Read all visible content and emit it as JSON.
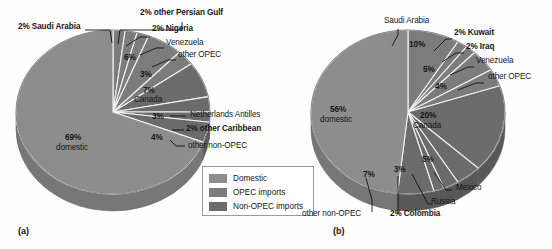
{
  "figure": {
    "background": "#fefefe",
    "colors": {
      "domestic": "#8d8d8d",
      "opec": "#7c7c7c",
      "non_opec": "#6b6b6b",
      "domestic_side": "#777777",
      "opec_side": "#666666",
      "non_opec_side": "#585858",
      "separator": "#f2f2f2",
      "outline": "#5a5a5a",
      "text": "#161616",
      "legend_border": "#9a9a9a"
    }
  },
  "legend": {
    "name": "legend",
    "items": [
      {
        "label": "Domestic",
        "color": "#8d8d8d",
        "swatch_name": "legend-swatch-domestic"
      },
      {
        "label": "OPEC imports",
        "color": "#7c7c7c",
        "swatch_name": "legend-swatch-opec"
      },
      {
        "label": "Non-OPEC imports",
        "color": "#6b6b6b",
        "swatch_name": "legend-swatch-non-opec"
      }
    ]
  },
  "chart_data": [
    {
      "type": "pie",
      "id": "a",
      "panel_label": "(a)",
      "title": "",
      "legend_position": "bottom-right",
      "categories": [
        "domestic",
        "Saudi Arabia",
        "other Persian Gulf",
        "Nigeria",
        "Venezuela",
        "other OPEC",
        "Canada",
        "Netherlands Antilles",
        "other Caribbean",
        "other non-OPEC"
      ],
      "values": [
        69,
        2,
        2,
        2,
        6,
        3,
        7,
        3,
        2,
        4
      ],
      "units": "percent",
      "slices": [
        {
          "name": "Saudi Arabia",
          "value": 2,
          "pct_text": "2%",
          "label": "Saudi Arabia",
          "group": "opec"
        },
        {
          "name": "other Persian Gulf",
          "value": 2,
          "pct_text": "2%",
          "label": "other Persian Gulf",
          "group": "opec"
        },
        {
          "name": "Nigeria",
          "value": 2,
          "pct_text": "2%",
          "label": "Nigeria",
          "group": "opec"
        },
        {
          "name": "Venezuela",
          "value": 6,
          "pct_text": "6%",
          "label": "Venezuela",
          "group": "opec"
        },
        {
          "name": "other OPEC",
          "value": 3,
          "pct_text": "3%",
          "label": "other OPEC",
          "group": "opec"
        },
        {
          "name": "Canada",
          "value": 7,
          "pct_text": "7%",
          "label": "Canada",
          "group": "non_opec"
        },
        {
          "name": "Netherlands Antilles",
          "value": 3,
          "pct_text": "3%",
          "label": "Netherlands Antilles",
          "group": "non_opec"
        },
        {
          "name": "other Caribbean",
          "value": 2,
          "pct_text": "2%",
          "label": "other Caribbean",
          "group": "non_opec"
        },
        {
          "name": "other non-OPEC",
          "value": 4,
          "pct_text": "4%",
          "label": "other non-OPEC",
          "group": "non_opec"
        },
        {
          "name": "domestic",
          "value": 69,
          "pct_text": "69%",
          "label": "domestic",
          "group": "domestic"
        }
      ],
      "labels": {
        "saudi_arabia": "2% Saudi Arabia",
        "other_persian_gulf": "2% other Persian Gulf",
        "nigeria": "2% Nigeria",
        "venezuela_pct": "6%",
        "venezuela": "Venezuela",
        "other_opec_pct": "3%",
        "other_opec": "other OPEC",
        "canada_pct": "7%",
        "canada": "Canada",
        "netherlands_pct": "3%",
        "netherlands": "Netherlands Antilles",
        "other_caribbean": "2% other Caribbean",
        "other_non_opec_pct": "4%",
        "other_non_opec": "other non-OPEC",
        "domestic_pct": "69%",
        "domestic": "domestic"
      }
    },
    {
      "type": "pie",
      "id": "b",
      "panel_label": "(b)",
      "title": "",
      "legend_position": "none",
      "categories": [
        "domestic",
        "Saudi Arabia",
        "Kuwait",
        "Iraq",
        "Venezuela",
        "other OPEC",
        "Canada",
        "Mexico",
        "Russia",
        "Colombia",
        "other non-OPEC"
      ],
      "values": [
        56,
        10,
        2,
        2,
        5,
        4,
        20,
        5,
        3,
        2,
        7
      ],
      "units": "percent",
      "slices": [
        {
          "name": "Saudi Arabia",
          "value": 10,
          "pct_text": "10%",
          "label": "Saudi Arabia",
          "group": "opec"
        },
        {
          "name": "Kuwait",
          "value": 2,
          "pct_text": "2%",
          "label": "Kuwait",
          "group": "opec"
        },
        {
          "name": "Iraq",
          "value": 2,
          "pct_text": "2%",
          "label": "Iraq",
          "group": "opec"
        },
        {
          "name": "Venezuela",
          "value": 5,
          "pct_text": "5%",
          "label": "Venezuela",
          "group": "opec"
        },
        {
          "name": "other OPEC",
          "value": 4,
          "pct_text": "4%",
          "label": "other OPEC",
          "group": "opec"
        },
        {
          "name": "Canada",
          "value": 20,
          "pct_text": "20%",
          "label": "Canada",
          "group": "non_opec"
        },
        {
          "name": "Mexico",
          "value": 5,
          "pct_text": "5%",
          "label": "Mexico",
          "group": "non_opec"
        },
        {
          "name": "Russia",
          "value": 3,
          "pct_text": "3%",
          "label": "Russia",
          "group": "non_opec"
        },
        {
          "name": "Colombia",
          "value": 2,
          "pct_text": "2%",
          "label": "Colombia",
          "group": "non_opec"
        },
        {
          "name": "other non-OPEC",
          "value": 7,
          "pct_text": "7%",
          "label": "other non-OPEC",
          "group": "non_opec"
        },
        {
          "name": "domestic",
          "value": 56,
          "pct_text": "56%",
          "label": "domestic",
          "group": "domestic"
        }
      ],
      "labels": {
        "saudi_arabia": "Saudi Arabia",
        "saudi_arabia_pct": "10%",
        "kuwait": "2% Kuwait",
        "iraq": "2% Iraq",
        "venezuela": "Venezuela",
        "venezuela_pct": "5%",
        "other_opec": "other OPEC",
        "other_opec_pct": "4%",
        "canada_pct": "20%",
        "canada": "Canada",
        "mexico_pct": "5%",
        "mexico": "Mexico",
        "russia_pct": "3%",
        "russia": "Russia",
        "colombia": "2% Colombia",
        "other_non_opec_pct": "7%",
        "other_non_opec": "other non-OPEC",
        "domestic_pct": "56%",
        "domestic": "domestic"
      }
    }
  ]
}
